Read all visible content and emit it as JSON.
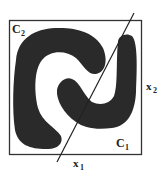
{
  "diagram": {
    "labels": {
      "class_2": "C",
      "class_2_sub": "2",
      "class_1": "C",
      "class_1_sub": "1",
      "axis_x1": "x",
      "axis_x1_sub": "1",
      "axis_x2": "x",
      "axis_x2_sub": "2"
    },
    "colors": {
      "region_fill": "#2a2a2a",
      "frame": "#333333",
      "background": "#ffffff",
      "line": "#222222"
    }
  }
}
